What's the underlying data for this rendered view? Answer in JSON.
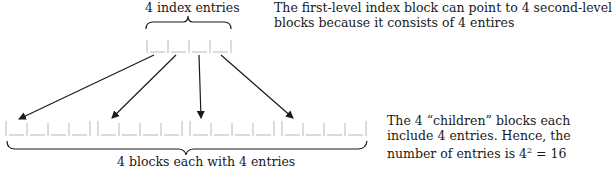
{
  "top_label": "4 index entries",
  "right_top_note": {
    "line1": "The first-level index block can point to 4 second-level",
    "line2": "blocks because it consists of 4 entires"
  },
  "right_bottom_note": {
    "line1": "The 4 “children” blocks each",
    "line2": "include 4 entries. Hence, the",
    "line3_prefix": "number of entries is 4",
    "line3_sup": "2",
    "line3_suffix": " = 16"
  },
  "bottom_label": "4 blocks each with 4 entries",
  "structure": {
    "first_level_entries": 4,
    "second_level_blocks": 4,
    "entries_per_block": 4,
    "total_entries": 16
  },
  "colors": {
    "line": "#1a1a1a",
    "block": "#b0b0b0"
  }
}
